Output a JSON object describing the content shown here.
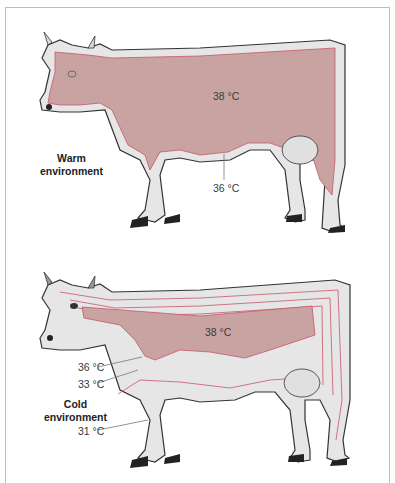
{
  "figure": {
    "panels": [
      {
        "id": "warm",
        "environment_label_line1": "Warm",
        "environment_label_line2": "environment",
        "core_temp": "38 °C",
        "isotherms": [
          "36 °C"
        ]
      },
      {
        "id": "cold",
        "environment_label_line1": "Cold",
        "environment_label_line2": "environment",
        "core_temp": "38 °C",
        "isotherms": [
          "36 °C",
          "33 °C",
          "31 °C"
        ]
      }
    ],
    "colors": {
      "core": "#c9a3a2",
      "shell": "#e6e6e6",
      "isotherm_line": "#c8566a",
      "outline": "#333333",
      "frame": "#b9bfcf"
    }
  }
}
